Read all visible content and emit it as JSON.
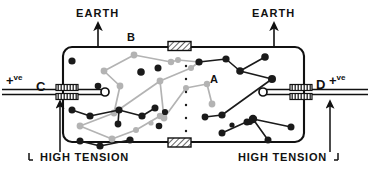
{
  "figure": {
    "kind": "spark-chamber-schematic",
    "labels": {
      "earth_left": "EARTH",
      "earth_right": "EARTH",
      "high_tension_left": "HIGH TENSION",
      "high_tension_right": "HIGH TENSION",
      "electrode_left": "C",
      "electrode_right": "D",
      "track_label_b": "B",
      "track_label_a": "A",
      "polarity_plus": "+",
      "polarity_sup": "ve"
    },
    "colors": {
      "outline": "#111111",
      "dark_track": "#1a1a1a",
      "light_track": "#b0b0b0",
      "hatch_fill": "#ffffff",
      "background": "#ffffff"
    },
    "chamber": {
      "x": 63,
      "y": 47,
      "width": 241,
      "height": 95,
      "corner_radius": 9
    },
    "insulators": [
      {
        "name": "top-insulator",
        "x": 168,
        "y": 42,
        "width": 22,
        "height": 9
      },
      {
        "name": "bottom-insulator",
        "x": 168,
        "y": 138,
        "width": 22,
        "height": 9
      },
      {
        "name": "left-bushing",
        "x": 56,
        "y": 85,
        "width": 22,
        "height": 14
      },
      {
        "name": "right-bushing",
        "x": 290,
        "y": 85,
        "width": 22,
        "height": 14
      }
    ],
    "dark_tracks": [
      {
        "points": [
          [
            72,
            61
          ]
        ]
      },
      {
        "points": [
          [
            141,
            72
          ]
        ]
      },
      {
        "points": [
          [
            158,
            68
          ]
        ]
      },
      {
        "points": [
          [
            98,
            86
          ]
        ]
      },
      {
        "points": [
          [
            199,
            62
          ],
          [
            226,
            59
          ],
          [
            240,
            71
          ],
          [
            272,
            79
          ],
          [
            265,
            57
          ]
        ]
      },
      {
        "points": [
          [
            240,
            71
          ],
          [
            207,
            86
          ]
        ]
      },
      {
        "points": [
          [
            272,
            79
          ],
          [
            222,
            115
          ]
        ]
      },
      {
        "points": [
          [
            222,
            115
          ],
          [
            205,
            117
          ]
        ]
      },
      {
        "points": [
          [
            72,
            110
          ],
          [
            90,
            116
          ],
          [
            119,
            110
          ],
          [
            142,
            116
          ],
          [
            155,
            108
          ]
        ]
      },
      {
        "points": [
          [
            119,
            110
          ],
          [
            118,
            124
          ]
        ]
      },
      {
        "points": [
          [
            80,
            141
          ],
          [
            100,
            146
          ],
          [
            130,
            140
          ]
        ]
      },
      {
        "points": [
          [
            100,
            146
          ],
          [
            130,
            140
          ]
        ]
      },
      {
        "points": [
          [
            159,
            126
          ]
        ]
      },
      {
        "points": [
          [
            165,
            112
          ]
        ]
      },
      {
        "points": [
          [
            247,
            122
          ],
          [
            253,
            119
          ],
          [
            291,
            127
          ]
        ]
      },
      {
        "points": [
          [
            253,
            119
          ],
          [
            222,
            133
          ]
        ]
      },
      {
        "points": [
          [
            253,
            119
          ],
          [
            268,
            140
          ]
        ]
      },
      {
        "points": [
          [
            253,
            119
          ],
          [
            250,
            122
          ]
        ]
      },
      {
        "points": [
          [
            232,
            125
          ]
        ]
      }
    ],
    "light_tracks": [
      {
        "points": [
          [
            134,
            55
          ],
          [
            104,
            71
          ],
          [
            120,
            86
          ],
          [
            114,
            113
          ],
          [
            80,
            126
          ],
          [
            112,
            139
          ]
        ]
      },
      {
        "points": [
          [
            134,
            55
          ],
          [
            171,
            62
          ],
          [
            178,
            60
          ]
        ]
      },
      {
        "points": [
          [
            178,
            60
          ],
          [
            199,
            62
          ]
        ]
      },
      {
        "points": [
          [
            160,
            81
          ],
          [
            164,
            118
          ],
          [
            186,
            88
          ],
          [
            207,
            84
          ]
        ]
      },
      {
        "points": [
          [
            114,
            113
          ],
          [
            160,
            81
          ]
        ]
      },
      {
        "points": [
          [
            112,
            139
          ],
          [
            136,
            130
          ],
          [
            160,
            116
          ]
        ]
      },
      {
        "points": [
          [
            207,
            84
          ],
          [
            212,
            104
          ]
        ]
      },
      {
        "points": [
          [
            191,
            68
          ],
          [
            199,
            62
          ]
        ]
      },
      {
        "points": [
          [
            160,
            81
          ],
          [
            191,
            68
          ]
        ]
      }
    ],
    "dots_column": {
      "x": 186,
      "y_values": [
        66,
        79,
        92,
        105,
        118,
        131
      ],
      "radius": 1.2
    },
    "leads": {
      "left_wire_label": "+ve",
      "right_wire_label": "+ve",
      "left_terminal_circle": {
        "cx": 105,
        "cy": 92,
        "r": 4
      },
      "right_terminal_circle": {
        "cx": 263,
        "cy": 92,
        "r": 4
      }
    },
    "arrows": [
      {
        "name": "earth-arrow-left",
        "x": 98,
        "from_y": 45,
        "to_y": 24
      },
      {
        "name": "earth-arrow-right",
        "x": 274,
        "from_y": 45,
        "to_y": 24
      },
      {
        "name": "ht-arrow-left",
        "x": 29,
        "from_y": 152,
        "to_y": 104
      },
      {
        "name": "ht-arrow-right",
        "x": 330,
        "from_y": 152,
        "to_y": 104
      }
    ]
  }
}
